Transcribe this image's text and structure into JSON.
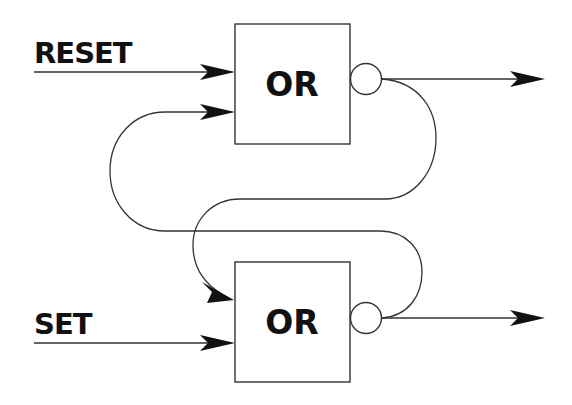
{
  "diagram": {
    "type": "SR latch (cross-coupled NOR built from OR gates with inverting bubbles)",
    "colors": {
      "line": "#333333",
      "text": "#111111",
      "background": "#ffffff"
    },
    "inputs": {
      "reset": {
        "label": "RESET"
      },
      "set": {
        "label": "SET"
      }
    },
    "gates": [
      {
        "id": "top-gate",
        "label": "OR",
        "inverted_output": true
      },
      {
        "id": "bottom-gate",
        "label": "OR",
        "inverted_output": true
      }
    ],
    "connections": [
      {
        "from": "RESET",
        "to": "top-gate"
      },
      {
        "from": "SET",
        "to": "bottom-gate"
      },
      {
        "from": "top-gate output",
        "to": "bottom-gate input (feedback)"
      },
      {
        "from": "bottom-gate output",
        "to": "top-gate input (feedback)"
      },
      {
        "from": "top-gate output",
        "to": "output arrow (right)"
      },
      {
        "from": "bottom-gate output",
        "to": "output arrow (right)"
      }
    ]
  }
}
